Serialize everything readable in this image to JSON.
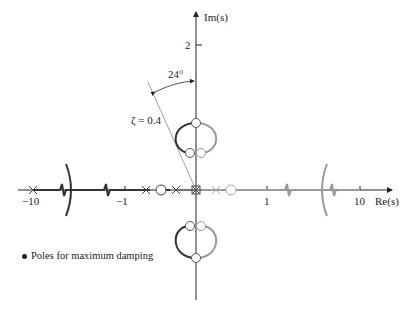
{
  "figure": {
    "axes": {
      "x_label": "Re(s)",
      "y_label": "Im(s)",
      "x_ticks": [
        "−10",
        "−1",
        "1",
        "10"
      ],
      "y_ticks": [
        "2"
      ]
    },
    "annotations": {
      "angle": "24°",
      "damping_line": "ζ = 0.4"
    },
    "legend": {
      "text": "Poles for maximum damping"
    },
    "colors": {
      "dark_branch": "#333333",
      "light_branch": "#9a9a9a",
      "axis": "#222222"
    }
  }
}
